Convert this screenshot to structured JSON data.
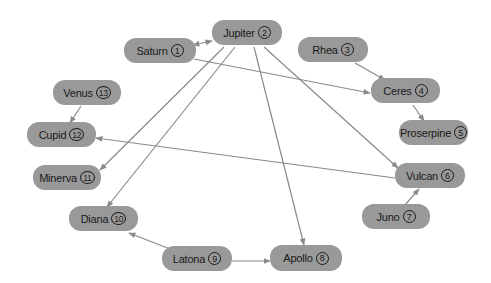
{
  "diagram": {
    "type": "directed-graph",
    "colors": {
      "node_fill": "#999999",
      "edge": "#8a8a8a",
      "text": "#1a1a1a",
      "background": "#ffffff"
    },
    "nodes": [
      {
        "id": 1,
        "label": "Saturn",
        "num": "1",
        "x": 124,
        "y": 38,
        "w": 72,
        "h": 25
      },
      {
        "id": 2,
        "label": "Jupiter",
        "num": "2",
        "x": 212,
        "y": 20,
        "w": 70,
        "h": 25
      },
      {
        "id": 3,
        "label": "Rhea",
        "num": "3",
        "x": 298,
        "y": 37,
        "w": 70,
        "h": 25
      },
      {
        "id": 4,
        "label": "Ceres",
        "num": "4",
        "x": 371,
        "y": 78,
        "w": 69,
        "h": 25
      },
      {
        "id": 5,
        "label": "Proserpine",
        "num": "5",
        "x": 399,
        "y": 120,
        "w": 69,
        "h": 25
      },
      {
        "id": 6,
        "label": "Vulcan",
        "num": "6",
        "x": 395,
        "y": 163,
        "w": 70,
        "h": 25
      },
      {
        "id": 7,
        "label": "Juno",
        "num": "7",
        "x": 362,
        "y": 204,
        "w": 68,
        "h": 25
      },
      {
        "id": 8,
        "label": "Apollo",
        "num": "8",
        "x": 270,
        "y": 245,
        "w": 72,
        "h": 26
      },
      {
        "id": 9,
        "label": "Latona",
        "num": "9",
        "x": 162,
        "y": 246,
        "w": 70,
        "h": 25
      },
      {
        "id": 10,
        "label": "Diana",
        "num": "10",
        "x": 69,
        "y": 206,
        "w": 69,
        "h": 25
      },
      {
        "id": 11,
        "label": "Minerva",
        "num": "11",
        "x": 33,
        "y": 165,
        "w": 68,
        "h": 25
      },
      {
        "id": 12,
        "label": "Cupid",
        "num": "12",
        "x": 27,
        "y": 122,
        "w": 69,
        "h": 25
      },
      {
        "id": 13,
        "label": "Venus",
        "num": "13",
        "x": 53,
        "y": 80,
        "w": 68,
        "h": 25
      }
    ],
    "edges": [
      {
        "from": "Saturn",
        "to": "Jupiter",
        "x1": 193,
        "y1": 45,
        "x2": 212,
        "y2": 41,
        "bidirectional": true
      },
      {
        "from": "Saturn",
        "to": "Ceres",
        "x1": 194,
        "y1": 59,
        "x2": 370,
        "y2": 93
      },
      {
        "from": "Rhea",
        "to": "Ceres",
        "x1": 355,
        "y1": 63,
        "x2": 385,
        "y2": 80
      },
      {
        "from": "Ceres",
        "to": "Proserpine",
        "x1": 413,
        "y1": 105,
        "x2": 424,
        "y2": 121
      },
      {
        "from": "Jupiter",
        "to": "Minerva",
        "x1": 224,
        "y1": 47,
        "x2": 100,
        "y2": 170
      },
      {
        "from": "Jupiter",
        "to": "Diana",
        "x1": 235,
        "y1": 47,
        "x2": 107,
        "y2": 207
      },
      {
        "from": "Jupiter",
        "to": "Apollo",
        "x1": 254,
        "y1": 47,
        "x2": 304,
        "y2": 245
      },
      {
        "from": "Jupiter",
        "to": "Vulcan",
        "x1": 264,
        "y1": 47,
        "x2": 398,
        "y2": 168
      },
      {
        "from": "Vulcan",
        "to": "Cupid",
        "x1": 395,
        "y1": 178,
        "x2": 96,
        "y2": 138
      },
      {
        "from": "Juno",
        "to": "Vulcan",
        "x1": 405,
        "y1": 205,
        "x2": 419,
        "y2": 189
      },
      {
        "from": "Venus",
        "to": "Cupid",
        "x1": 81,
        "y1": 106,
        "x2": 70,
        "y2": 123
      },
      {
        "from": "Latona",
        "to": "Diana",
        "x1": 170,
        "y1": 249,
        "x2": 129,
        "y2": 233
      },
      {
        "from": "Latona",
        "to": "Apollo",
        "x1": 232,
        "y1": 261,
        "x2": 270,
        "y2": 261
      }
    ]
  }
}
